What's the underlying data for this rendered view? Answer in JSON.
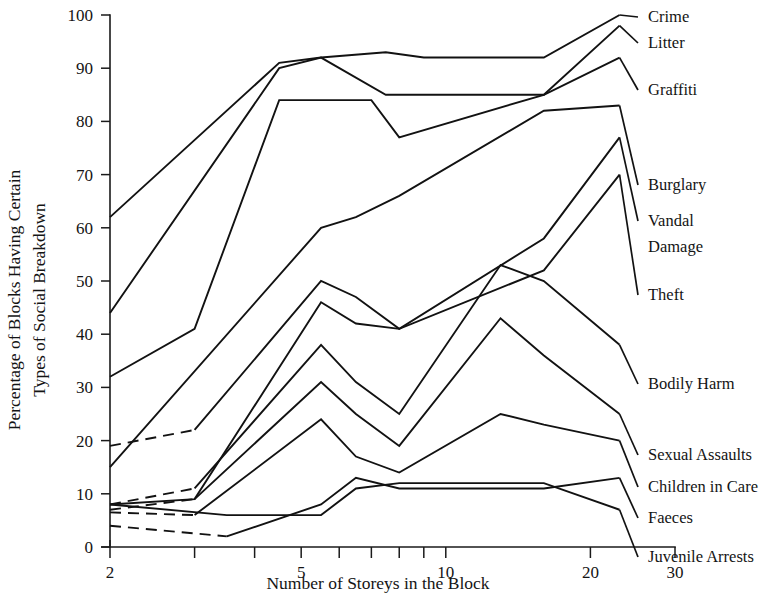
{
  "chart_data": {
    "type": "line",
    "title": "",
    "xlabel": "Number of Storeys in the Block",
    "ylabel": "Percentage of Blocks Having Certain Types of Social Breakdown",
    "ylabel_line1": "Percentage of Blocks Having Certain",
    "ylabel_line2": "Types of Social Breakdown",
    "xscale": "log",
    "xlim": [
      2,
      30
    ],
    "ylim": [
      0,
      100
    ],
    "grid": false,
    "legend_position": "right-of-plot-inline-labels",
    "x_ticks": [
      2,
      3,
      4,
      5,
      6,
      7,
      8,
      9,
      10,
      20,
      30
    ],
    "x_tick_labels": [
      "2",
      "",
      "",
      "5",
      "",
      "",
      "",
      "",
      "10",
      "20",
      "30"
    ],
    "y_ticks": [
      0,
      10,
      20,
      30,
      40,
      50,
      60,
      70,
      80,
      90,
      100
    ],
    "y_tick_labels": [
      "0",
      "10",
      "20",
      "30",
      "40",
      "50",
      "60",
      "70",
      "80",
      "90",
      "100"
    ],
    "series": [
      {
        "name": "Crime",
        "label": "Crime",
        "style": "solid",
        "x": [
          2,
          4.5,
          5.5,
          7.5,
          9,
          16,
          23
        ],
        "values": [
          62,
          91,
          92,
          93,
          92,
          92,
          100
        ]
      },
      {
        "name": "Litter",
        "label": "Litter",
        "style": "solid",
        "x": [
          2,
          4.5,
          5.5,
          7.5,
          9,
          16,
          23
        ],
        "values": [
          44,
          90,
          92,
          85,
          85,
          85,
          98
        ]
      },
      {
        "name": "Graffiti",
        "label": "Graffiti",
        "style": "solid",
        "x": [
          2,
          3,
          4.5,
          5.5,
          7,
          8,
          16,
          23
        ],
        "values": [
          32,
          41,
          84,
          84,
          84,
          77,
          85,
          92
        ]
      },
      {
        "name": "Burglary",
        "label": "Burglary",
        "style": "solid",
        "x": [
          2,
          5.5,
          6.5,
          8,
          16,
          23
        ],
        "values": [
          15,
          60,
          62,
          66,
          82,
          83
        ]
      },
      {
        "name": "Vandal Damage",
        "label": "Vandal Damage",
        "label_line1": "Vandal",
        "label_line2": "Damage",
        "style": "dashed-then-solid",
        "x": [
          2,
          3,
          5.5,
          6.5,
          8,
          16,
          23
        ],
        "values": [
          19,
          22,
          50,
          47,
          41,
          58,
          77
        ]
      },
      {
        "name": "Theft",
        "label": "Theft",
        "style": "solid",
        "x": [
          2,
          3,
          5.5,
          6.5,
          8,
          16,
          23
        ],
        "values": [
          8,
          9,
          46,
          42,
          41,
          52,
          70
        ]
      },
      {
        "name": "Bodily Harm",
        "label": "Bodily Harm",
        "style": "dashed-then-solid",
        "x": [
          2,
          3,
          5.5,
          6.5,
          8,
          13,
          16,
          23
        ],
        "values": [
          8,
          11,
          38,
          31,
          25,
          53,
          50,
          38
        ]
      },
      {
        "name": "Sexual Assaults",
        "label": "Sexual Assaults",
        "style": "dashed-then-solid",
        "x": [
          2,
          3,
          5.5,
          6.5,
          8,
          13,
          16,
          23
        ],
        "values": [
          7,
          9,
          31,
          25,
          19,
          43,
          36,
          25
        ]
      },
      {
        "name": "Children in Care",
        "label": "Children in Care",
        "style": "dashed-then-solid",
        "x": [
          2,
          3,
          5.5,
          6.5,
          8,
          13,
          16,
          23
        ],
        "values": [
          6.5,
          6,
          24,
          17,
          14,
          25,
          23,
          20
        ]
      },
      {
        "name": "Faeces",
        "label": "Faeces",
        "style": "dashed-then-solid",
        "x": [
          2,
          3.5,
          5.5,
          6.5,
          8,
          13,
          16,
          23
        ],
        "values": [
          4,
          2,
          8,
          13,
          11,
          11,
          11,
          13
        ]
      },
      {
        "name": "Juvenile Arrests",
        "label": "Juvenile Arrests",
        "style": "solid",
        "x": [
          2,
          3.5,
          5.5,
          6.5,
          8,
          16,
          23
        ],
        "values": [
          8,
          6,
          6,
          11,
          12,
          12,
          7
        ]
      }
    ],
    "right_labels": [
      "Crime",
      "Litter",
      "Graffiti",
      "Burglary",
      "Vandal",
      "Damage",
      "Theft",
      "Bodily Harm",
      "Sexual Assaults",
      "Children in Care",
      "Faeces",
      "Juvenile Arrests"
    ]
  }
}
